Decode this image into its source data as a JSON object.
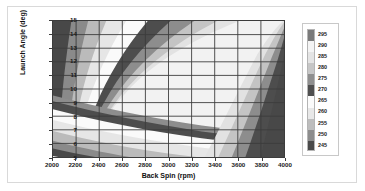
{
  "chart_data": {
    "type": "heatmap",
    "title": "",
    "xlabel": "Back Spin (rpm)",
    "ylabel": "Launch Angle (deg)",
    "xlim": [
      2000,
      4000
    ],
    "ylim": [
      5,
      15
    ],
    "xticks": [
      2000,
      2200,
      2400,
      2600,
      2800,
      3000,
      3200,
      3400,
      3600,
      3800,
      4000
    ],
    "yticks": [
      5,
      6,
      7,
      8,
      9,
      10,
      11,
      12,
      13,
      14,
      15
    ],
    "grid": true,
    "legend_position": "right",
    "legend_title": "",
    "zlabel": "Carry Distance (yds)",
    "levels": [
      245,
      250,
      255,
      260,
      265,
      270,
      275,
      280,
      285,
      290,
      295
    ],
    "level_colors": [
      "#4a4a4a",
      "#8c8c8c",
      "#bdbdbd",
      "#e8e8e8",
      "#fbfbfb",
      "#4f4f4f",
      "#8f8f8f",
      "#c6c6c6",
      "#e4e4e4",
      "#f4f4f4",
      "#7a7a7a"
    ],
    "colorbar_labels": [
      295,
      290,
      285,
      280,
      275,
      270,
      265,
      260,
      255,
      250,
      245
    ],
    "contour_bands": [
      {
        "level": 295,
        "shade": "#6f6f6f",
        "note": "peak ridge, upper-center"
      },
      {
        "level": 290,
        "shade": "#f2f2f2",
        "note": "surrounds peak"
      },
      {
        "level": 285,
        "shade": "#e2e2e2",
        "note": ""
      },
      {
        "level": 280,
        "shade": "#c4c4c4",
        "note": ""
      },
      {
        "level": 275,
        "shade": "#8d8d8d",
        "note": ""
      },
      {
        "level": 270,
        "shade": "#4d4d4d",
        "note": "dark U-shaped band"
      },
      {
        "level": 265,
        "shade": "#fafafa",
        "note": ""
      },
      {
        "level": 260,
        "shade": "#e6e6e6",
        "note": ""
      },
      {
        "level": 255,
        "shade": "#bbbbbb",
        "note": ""
      },
      {
        "level": 250,
        "shade": "#8a8a8a",
        "note": ""
      },
      {
        "level": 245,
        "shade": "#484848",
        "note": "darkest, lower-left corner and far right"
      }
    ]
  },
  "axes": {
    "x": {
      "label": "Back Spin (rpm)",
      "ticks": [
        "2000",
        "2200",
        "2400",
        "2600",
        "2800",
        "3000",
        "3200",
        "3400",
        "3600",
        "3800",
        "4000"
      ]
    },
    "y": {
      "label": "Launch Angle (deg)",
      "ticks": [
        "15",
        "14",
        "13",
        "12",
        "11",
        "10",
        "9",
        "8",
        "7",
        "6",
        "5"
      ]
    }
  },
  "legend": {
    "labels": [
      "295",
      "290",
      "285",
      "280",
      "275",
      "270",
      "265",
      "260",
      "255",
      "250",
      "245"
    ]
  }
}
